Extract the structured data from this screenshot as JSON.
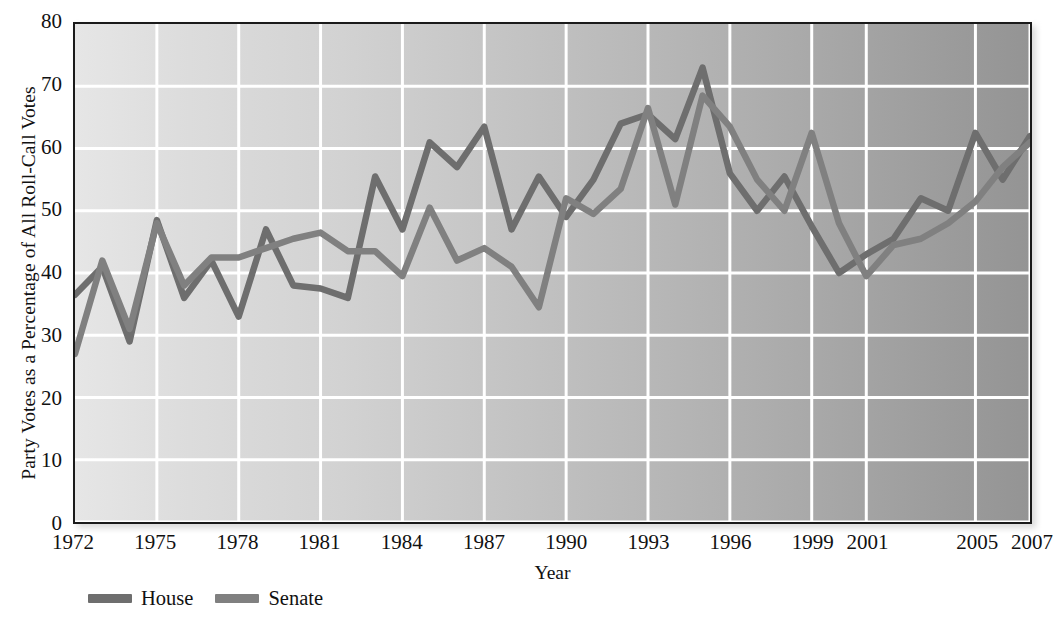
{
  "chart_data": {
    "type": "line",
    "title": "",
    "xlabel": "Year",
    "ylabel": "Party Votes as a Percentage of All Roll-Call Votes",
    "ylim": [
      0,
      80
    ],
    "yticks": [
      0,
      10,
      20,
      30,
      40,
      50,
      60,
      70,
      80
    ],
    "xlim": [
      1972,
      2007
    ],
    "xticks": [
      1972,
      1975,
      1978,
      1981,
      1984,
      1987,
      1990,
      1993,
      1996,
      1999,
      2001,
      2005,
      2007
    ],
    "xtick_labels": [
      "1972",
      "1975",
      "1978",
      "1981",
      "1984",
      "1987",
      "1990",
      "1993",
      "1996",
      "1999",
      "2001",
      "2005",
      "2007"
    ],
    "grid": true,
    "legend_position": "below-left",
    "x": [
      1972,
      1973,
      1974,
      1975,
      1976,
      1977,
      1978,
      1979,
      1980,
      1981,
      1982,
      1983,
      1984,
      1985,
      1986,
      1987,
      1988,
      1989,
      1990,
      1991,
      1992,
      1993,
      1994,
      1995,
      1996,
      1997,
      1998,
      1999,
      2000,
      2001,
      2002,
      2003,
      2004,
      2005,
      2006,
      2007
    ],
    "series": [
      {
        "name": "House",
        "color": "#6e6e6e",
        "values": [
          36.5,
          41.0,
          29.0,
          48.5,
          36.0,
          42.0,
          33.0,
          47.0,
          38.0,
          37.5,
          36.0,
          55.5,
          47.0,
          61.0,
          57.0,
          63.5,
          47.0,
          55.5,
          49.0,
          55.0,
          64.0,
          65.5,
          61.5,
          73.0,
          56.0,
          50.0,
          55.5,
          47.5,
          40.0,
          43.0,
          45.5,
          52.0,
          50.0,
          62.5,
          55.0,
          62.0
        ]
      },
      {
        "name": "Senate",
        "color": "#808080",
        "values": [
          27.0,
          42.0,
          31.0,
          48.0,
          38.0,
          42.5,
          42.5,
          44.0,
          45.5,
          46.5,
          43.5,
          43.5,
          39.5,
          50.5,
          42.0,
          44.0,
          41.0,
          34.5,
          52.0,
          49.5,
          53.5,
          66.5,
          51.0,
          68.5,
          63.5,
          55.0,
          50.0,
          62.5,
          48.0,
          39.5,
          44.5,
          45.5,
          48.0,
          51.5,
          57.0,
          61.0
        ]
      }
    ]
  },
  "legend": {
    "items": [
      {
        "label": "House",
        "color": "#6e6e6e"
      },
      {
        "label": "Senate",
        "color": "#808080"
      }
    ]
  }
}
